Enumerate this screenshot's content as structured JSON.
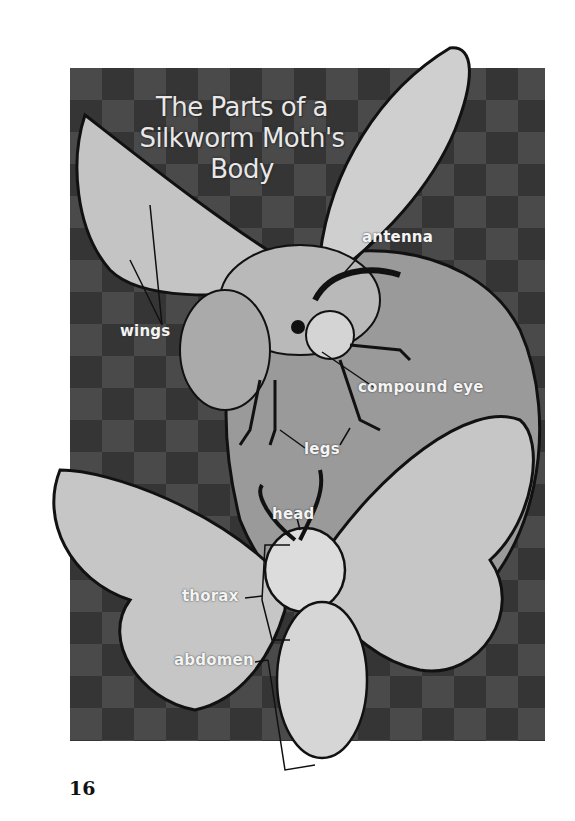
{
  "page": {
    "title": "The Parts of a Silkworm Moth's Body",
    "title_lines": [
      "The Parts of a",
      "Silkworm Moth's",
      "Body"
    ],
    "page_number": "16"
  },
  "labels": {
    "wings": "wings",
    "antenna": "antenna",
    "compound_eye": "compound eye",
    "legs": "legs",
    "head": "head",
    "thorax": "thorax",
    "abdomen": "abdomen"
  },
  "colors": {
    "background_dark": "#4a4a4a",
    "label_text": "#f4f4f4",
    "wing_fill": "#c9c9c9",
    "body_fill": "#dcdcdc",
    "outline": "#111111"
  }
}
